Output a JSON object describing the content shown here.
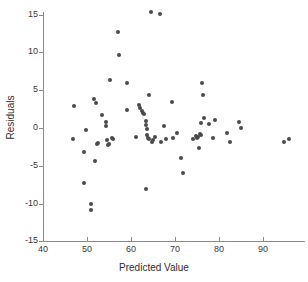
{
  "chart_data": {
    "type": "scatter",
    "title": "",
    "xlabel": "Predicted Value",
    "ylabel": "Residuals",
    "xlim": [
      38,
      98
    ],
    "ylim": [
      -15,
      16.5
    ],
    "xticks": [
      40,
      50,
      60,
      70,
      80,
      90
    ],
    "yticks": [
      15,
      10,
      5,
      0,
      -5,
      -10,
      -15
    ],
    "grid": false,
    "legend": null,
    "marker": {
      "shape": "circle",
      "color": "#4a4a4a",
      "size_px": 4
    },
    "axis_color": "#8a8a8a",
    "points": [
      {
        "x": 47.0,
        "y": 2.9
      },
      {
        "x": 46.8,
        "y": -1.5
      },
      {
        "x": 49.3,
        "y": -7.3
      },
      {
        "x": 49.4,
        "y": -3.2
      },
      {
        "x": 49.8,
        "y": -0.2
      },
      {
        "x": 50.9,
        "y": -10.0
      },
      {
        "x": 51.0,
        "y": -10.8
      },
      {
        "x": 51.6,
        "y": 3.8
      },
      {
        "x": 51.9,
        "y": -4.4
      },
      {
        "x": 52.0,
        "y": 3.3
      },
      {
        "x": 52.2,
        "y": -2.1
      },
      {
        "x": 52.4,
        "y": -2.0
      },
      {
        "x": 53.4,
        "y": 1.7
      },
      {
        "x": 54.3,
        "y": 0.8
      },
      {
        "x": 54.4,
        "y": 0.3
      },
      {
        "x": 54.6,
        "y": -1.6
      },
      {
        "x": 54.8,
        "y": -2.2
      },
      {
        "x": 55.0,
        "y": -2.1
      },
      {
        "x": 55.3,
        "y": 6.3
      },
      {
        "x": 55.6,
        "y": -1.3
      },
      {
        "x": 55.9,
        "y": -1.4
      },
      {
        "x": 57.1,
        "y": 12.7
      },
      {
        "x": 57.3,
        "y": 9.7
      },
      {
        "x": 59.1,
        "y": 6.0
      },
      {
        "x": 59.2,
        "y": 2.4
      },
      {
        "x": 61.2,
        "y": -1.2
      },
      {
        "x": 61.8,
        "y": 3.0
      },
      {
        "x": 62.0,
        "y": 2.7
      },
      {
        "x": 62.6,
        "y": 2.3
      },
      {
        "x": 62.8,
        "y": 2.0
      },
      {
        "x": 63.0,
        "y": 1.9
      },
      {
        "x": 63.3,
        "y": -8.1
      },
      {
        "x": 63.4,
        "y": 0.9
      },
      {
        "x": 63.5,
        "y": 0.4
      },
      {
        "x": 63.6,
        "y": -0.1
      },
      {
        "x": 63.7,
        "y": -0.9
      },
      {
        "x": 63.9,
        "y": -1.3
      },
      {
        "x": 64.0,
        "y": 4.3
      },
      {
        "x": 64.2,
        "y": -1.5
      },
      {
        "x": 64.5,
        "y": 15.3
      },
      {
        "x": 64.8,
        "y": -1.9
      },
      {
        "x": 65.0,
        "y": -1.6
      },
      {
        "x": 65.4,
        "y": -1.2
      },
      {
        "x": 66.6,
        "y": 15.1
      },
      {
        "x": 66.8,
        "y": -1.8
      },
      {
        "x": 67.4,
        "y": 0.3
      },
      {
        "x": 68.0,
        "y": -1.4
      },
      {
        "x": 69.4,
        "y": 3.4
      },
      {
        "x": 69.6,
        "y": -1.3
      },
      {
        "x": 70.4,
        "y": -0.7
      },
      {
        "x": 71.3,
        "y": -4.0
      },
      {
        "x": 71.8,
        "y": -6.0
      },
      {
        "x": 74.2,
        "y": -1.5
      },
      {
        "x": 74.8,
        "y": -1.1
      },
      {
        "x": 75.0,
        "y": -1.3
      },
      {
        "x": 75.2,
        "y": -1.2
      },
      {
        "x": 75.4,
        "y": -2.6
      },
      {
        "x": 75.6,
        "y": -0.8
      },
      {
        "x": 75.8,
        "y": -0.9
      },
      {
        "x": 76.0,
        "y": 0.6
      },
      {
        "x": 76.2,
        "y": 5.9
      },
      {
        "x": 76.3,
        "y": 4.3
      },
      {
        "x": 76.6,
        "y": 1.3
      },
      {
        "x": 77.7,
        "y": 0.5
      },
      {
        "x": 78.6,
        "y": -1.3
      },
      {
        "x": 79.1,
        "y": 1.0
      },
      {
        "x": 81.9,
        "y": -0.7
      },
      {
        "x": 82.6,
        "y": -1.9
      },
      {
        "x": 84.6,
        "y": 0.8
      },
      {
        "x": 85.1,
        "y": 0.0
      },
      {
        "x": 94.7,
        "y": -1.9
      },
      {
        "x": 95.8,
        "y": -1.4
      }
    ]
  }
}
